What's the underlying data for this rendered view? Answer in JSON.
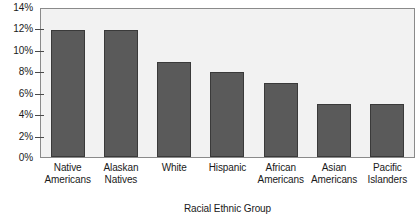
{
  "chart_data": {
    "type": "bar",
    "title": "",
    "xlabel": "Racial Ethnic Group",
    "ylabel": "",
    "categories": [
      "Native Americans",
      "Alaskan Natives",
      "White",
      "Hispanic",
      "African Americans",
      "Asian Americans",
      "Pacific Islanders"
    ],
    "category_lines": [
      [
        "Native",
        "Americans"
      ],
      [
        "Alaskan",
        "Natives"
      ],
      [
        "White"
      ],
      [
        "Hispanic"
      ],
      [
        "African",
        "Americans"
      ],
      [
        "Asian",
        "Americans"
      ],
      [
        "Pacific",
        "Islanders"
      ]
    ],
    "values": [
      12,
      12,
      9,
      8,
      7,
      5,
      5
    ],
    "value_labels": [
      "12%",
      "12%",
      "9%",
      "8%",
      "7%",
      "5%",
      "5%"
    ],
    "ylim": [
      0,
      14
    ],
    "ytick_values": [
      0,
      2,
      4,
      6,
      8,
      10,
      12,
      14
    ],
    "ytick_labels": [
      "0%",
      "2%",
      "4%",
      "6%",
      "8%",
      "10%",
      "12%",
      "14%"
    ],
    "grid": false,
    "legend": null,
    "colors": {
      "bar_fill": "#5a5a5a",
      "bar_border": "#3a3a3a",
      "plot_background": "#f2f2f2",
      "plot_border": "#8a8a8a",
      "page_background": "#ffffff",
      "text": "#1a1a1a"
    }
  }
}
